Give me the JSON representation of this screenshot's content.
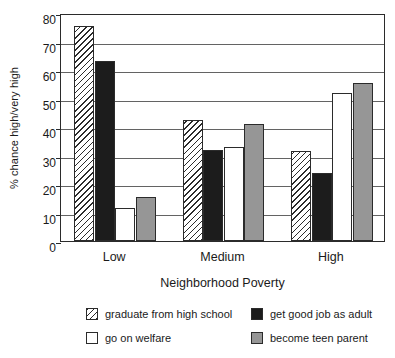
{
  "chart_data": {
    "type": "bar",
    "title": "",
    "xlabel": "Neighborhood Poverty",
    "ylabel": "% chance high/very high",
    "categories": [
      "Low",
      "Medium",
      "High"
    ],
    "ylim": [
      0,
      80
    ],
    "yticks": [
      0,
      10,
      20,
      30,
      40,
      50,
      60,
      70,
      80
    ],
    "grid": true,
    "legend_position": "bottom",
    "series": [
      {
        "name": "graduate from high school",
        "values": [
          75.5,
          42.5,
          31.5
        ],
        "swatch": "ser0",
        "color": "#ffffff",
        "pattern": "diagonal-hatch"
      },
      {
        "name": "get good job as adult",
        "values": [
          63.0,
          32.0,
          24.0
        ],
        "swatch": "ser1",
        "color": "#1c1c1c",
        "pattern": "solid"
      },
      {
        "name": "go on welfare",
        "values": [
          11.5,
          33.0,
          52.0
        ],
        "swatch": "ser2",
        "color": "#ffffff",
        "pattern": "solid"
      },
      {
        "name": "become teen parent",
        "values": [
          15.5,
          41.0,
          55.5
        ],
        "swatch": "ser3",
        "color": "#969696",
        "pattern": "solid"
      }
    ]
  }
}
